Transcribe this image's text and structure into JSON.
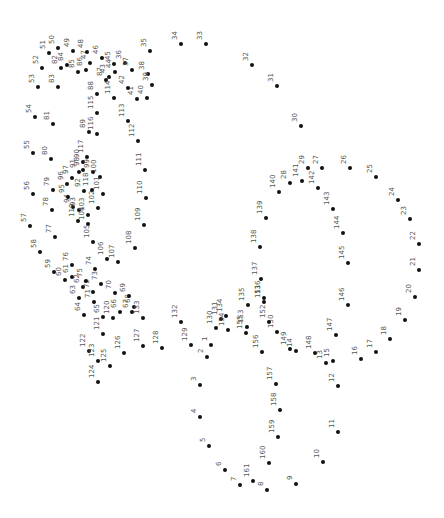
{
  "puzzle": {
    "type": "connect-the-dots",
    "total_dots": 161,
    "label_rotation_deg": -90,
    "dot_color": "#111111",
    "label_color": "#555555",
    "dots": [
      {
        "n": 1,
        "x": 211,
        "y": 345
      },
      {
        "n": 2,
        "x": 207,
        "y": 357
      },
      {
        "n": 3,
        "x": 200,
        "y": 385
      },
      {
        "n": 4,
        "x": 200,
        "y": 417
      },
      {
        "n": 5,
        "x": 209,
        "y": 446
      },
      {
        "n": 6,
        "x": 225,
        "y": 470
      },
      {
        "n": 7,
        "x": 240,
        "y": 485
      },
      {
        "n": 8,
        "x": 267,
        "y": 490
      },
      {
        "n": 9,
        "x": 296,
        "y": 484
      },
      {
        "n": 10,
        "x": 323,
        "y": 462
      },
      {
        "n": 11,
        "x": 338,
        "y": 432
      },
      {
        "n": 12,
        "x": 338,
        "y": 386
      },
      {
        "n": 13,
        "x": 326,
        "y": 363
      },
      {
        "n": 14,
        "x": 296,
        "y": 351
      },
      {
        "n": 15,
        "x": 333,
        "y": 361
      },
      {
        "n": 16,
        "x": 361,
        "y": 359
      },
      {
        "n": 17,
        "x": 376,
        "y": 352
      },
      {
        "n": 18,
        "x": 390,
        "y": 339
      },
      {
        "n": 19,
        "x": 405,
        "y": 320
      },
      {
        "n": 20,
        "x": 415,
        "y": 297
      },
      {
        "n": 21,
        "x": 419,
        "y": 270
      },
      {
        "n": 22,
        "x": 419,
        "y": 244
      },
      {
        "n": 23,
        "x": 410,
        "y": 219
      },
      {
        "n": 24,
        "x": 398,
        "y": 200
      },
      {
        "n": 25,
        "x": 376,
        "y": 177
      },
      {
        "n": 26,
        "x": 350,
        "y": 168
      },
      {
        "n": 27,
        "x": 322,
        "y": 168
      },
      {
        "n": 28,
        "x": 290,
        "y": 183
      },
      {
        "n": 29,
        "x": 308,
        "y": 168
      },
      {
        "n": 30,
        "x": 301,
        "y": 126
      },
      {
        "n": 31,
        "x": 277,
        "y": 86
      },
      {
        "n": 32,
        "x": 252,
        "y": 65
      },
      {
        "n": 33,
        "x": 206,
        "y": 44
      },
      {
        "n": 34,
        "x": 181,
        "y": 44
      },
      {
        "n": 35,
        "x": 150,
        "y": 51
      },
      {
        "n": 36,
        "x": 125,
        "y": 63
      },
      {
        "n": 37,
        "x": 132,
        "y": 70
      },
      {
        "n": 38,
        "x": 148,
        "y": 74
      },
      {
        "n": 39,
        "x": 152,
        "y": 85
      },
      {
        "n": 40,
        "x": 147,
        "y": 98
      },
      {
        "n": 41,
        "x": 137,
        "y": 99
      },
      {
        "n": 42,
        "x": 128,
        "y": 88
      },
      {
        "n": 43,
        "x": 109,
        "y": 77
      },
      {
        "n": 44,
        "x": 115,
        "y": 72
      },
      {
        "n": 45,
        "x": 114,
        "y": 64
      },
      {
        "n": 46,
        "x": 102,
        "y": 58
      },
      {
        "n": 47,
        "x": 90,
        "y": 63
      },
      {
        "n": 48,
        "x": 87,
        "y": 52
      },
      {
        "n": 49,
        "x": 73,
        "y": 51
      },
      {
        "n": 50,
        "x": 58,
        "y": 48
      },
      {
        "n": 51,
        "x": 49,
        "y": 53
      },
      {
        "n": 52,
        "x": 42,
        "y": 68
      },
      {
        "n": 53,
        "x": 38,
        "y": 87
      },
      {
        "n": 54,
        "x": 35,
        "y": 117
      },
      {
        "n": 55,
        "x": 33,
        "y": 153
      },
      {
        "n": 56,
        "x": 33,
        "y": 194
      },
      {
        "n": 57,
        "x": 30,
        "y": 226
      },
      {
        "n": 58,
        "x": 40,
        "y": 252
      },
      {
        "n": 59,
        "x": 54,
        "y": 272
      },
      {
        "n": 60,
        "x": 65,
        "y": 280
      },
      {
        "n": 61,
        "x": 72,
        "y": 277
      },
      {
        "n": 62,
        "x": 83,
        "y": 287
      },
      {
        "n": 63,
        "x": 79,
        "y": 298
      },
      {
        "n": 64,
        "x": 84,
        "y": 315
      },
      {
        "n": 65,
        "x": 103,
        "y": 317
      },
      {
        "n": 66,
        "x": 120,
        "y": 312
      },
      {
        "n": 67,
        "x": 132,
        "y": 312
      },
      {
        "n": 68,
        "x": 134,
        "y": 307
      },
      {
        "n": 69,
        "x": 129,
        "y": 296
      },
      {
        "n": 70,
        "x": 115,
        "y": 293
      },
      {
        "n": 71,
        "x": 94,
        "y": 302
      },
      {
        "n": 72,
        "x": 93,
        "y": 292
      },
      {
        "n": 73,
        "x": 101,
        "y": 284
      },
      {
        "n": 74,
        "x": 95,
        "y": 269
      },
      {
        "n": 75,
        "x": 86,
        "y": 281
      },
      {
        "n": 76,
        "x": 72,
        "y": 265
      },
      {
        "n": 77,
        "x": 55,
        "y": 237
      },
      {
        "n": 78,
        "x": 52,
        "y": 210
      },
      {
        "n": 79,
        "x": 53,
        "y": 190
      },
      {
        "n": 80,
        "x": 51,
        "y": 159
      },
      {
        "n": 81,
        "x": 53,
        "y": 124
      },
      {
        "n": 82,
        "x": 61,
        "y": 68
      },
      {
        "n": 83,
        "x": 58,
        "y": 87
      },
      {
        "n": 84,
        "x": 67,
        "y": 65
      },
      {
        "n": 85,
        "x": 78,
        "y": 72
      },
      {
        "n": 86,
        "x": 86,
        "y": 70
      },
      {
        "n": 87,
        "x": 106,
        "y": 80
      },
      {
        "n": 88,
        "x": 97,
        "y": 94
      },
      {
        "n": 89,
        "x": 89,
        "y": 132
      },
      {
        "n": 90,
        "x": 83,
        "y": 162
      },
      {
        "n": 91,
        "x": 79,
        "y": 172
      },
      {
        "n": 92,
        "x": 84,
        "y": 191
      },
      {
        "n": 93,
        "x": 79,
        "y": 210
      },
      {
        "n": 94,
        "x": 73,
        "y": 207
      },
      {
        "n": 95,
        "x": 68,
        "y": 197
      },
      {
        "n": 96,
        "x": 67,
        "y": 184
      },
      {
        "n": 97,
        "x": 72,
        "y": 178
      },
      {
        "n": 98,
        "x": 83,
        "y": 170
      },
      {
        "n": 99,
        "x": 93,
        "y": 172
      },
      {
        "n": 100,
        "x": 100,
        "y": 177
      },
      {
        "n": 101,
        "x": 103,
        "y": 194
      },
      {
        "n": 102,
        "x": 98,
        "y": 208
      },
      {
        "n": 103,
        "x": 88,
        "y": 215
      },
      {
        "n": 104,
        "x": 88,
        "y": 224
      },
      {
        "n": 105,
        "x": 93,
        "y": 242
      },
      {
        "n": 106,
        "x": 107,
        "y": 259
      },
      {
        "n": 107,
        "x": 118,
        "y": 262
      },
      {
        "n": 108,
        "x": 135,
        "y": 248
      },
      {
        "n": 109,
        "x": 144,
        "y": 225
      },
      {
        "n": 110,
        "x": 146,
        "y": 198
      },
      {
        "n": 111,
        "x": 145,
        "y": 170
      },
      {
        "n": 112,
        "x": 138,
        "y": 141
      },
      {
        "n": 113,
        "x": 128,
        "y": 121
      },
      {
        "n": 114,
        "x": 114,
        "y": 98
      },
      {
        "n": 115,
        "x": 97,
        "y": 113
      },
      {
        "n": 116,
        "x": 97,
        "y": 134
      },
      {
        "n": 117,
        "x": 87,
        "y": 157
      },
      {
        "n": 118,
        "x": 92,
        "y": 190
      },
      {
        "n": 119,
        "x": 78,
        "y": 221
      },
      {
        "n": 120,
        "x": 113,
        "y": 318
      },
      {
        "n": 121,
        "x": 103,
        "y": 334
      },
      {
        "n": 122,
        "x": 89,
        "y": 351
      },
      {
        "n": 123,
        "x": 98,
        "y": 361
      },
      {
        "n": 124,
        "x": 98,
        "y": 382
      },
      {
        "n": 125,
        "x": 110,
        "y": 366
      },
      {
        "n": 126,
        "x": 124,
        "y": 353
      },
      {
        "n": 127,
        "x": 143,
        "y": 346
      },
      {
        "n": 128,
        "x": 162,
        "y": 348
      },
      {
        "n": 129,
        "x": 191,
        "y": 345
      },
      {
        "n": 130,
        "x": 216,
        "y": 328
      },
      {
        "n": 131,
        "x": 221,
        "y": 319
      },
      {
        "n": 132,
        "x": 181,
        "y": 322
      },
      {
        "n": 133,
        "x": 143,
        "y": 318
      },
      {
        "n": 134,
        "x": 226,
        "y": 316
      },
      {
        "n": 135,
        "x": 248,
        "y": 305
      },
      {
        "n": 136,
        "x": 264,
        "y": 298
      },
      {
        "n": 137,
        "x": 261,
        "y": 279
      },
      {
        "n": 138,
        "x": 260,
        "y": 247
      },
      {
        "n": 139,
        "x": 266,
        "y": 218
      },
      {
        "n": 140,
        "x": 279,
        "y": 192
      },
      {
        "n": 141,
        "x": 302,
        "y": 181
      },
      {
        "n": 142,
        "x": 318,
        "y": 188
      },
      {
        "n": 143,
        "x": 333,
        "y": 209
      },
      {
        "n": 144,
        "x": 343,
        "y": 233
      },
      {
        "n": 145,
        "x": 348,
        "y": 263
      },
      {
        "n": 146,
        "x": 348,
        "y": 305
      },
      {
        "n": 147,
        "x": 336,
        "y": 335
      },
      {
        "n": 148,
        "x": 315,
        "y": 353
      },
      {
        "n": 149,
        "x": 290,
        "y": 349
      },
      {
        "n": 150,
        "x": 277,
        "y": 332
      },
      {
        "n": 151,
        "x": 264,
        "y": 302
      },
      {
        "n": 152,
        "x": 269,
        "y": 322
      },
      {
        "n": 153,
        "x": 247,
        "y": 327
      },
      {
        "n": 154,
        "x": 228,
        "y": 330
      },
      {
        "n": 155,
        "x": 246,
        "y": 333
      },
      {
        "n": 156,
        "x": 262,
        "y": 352
      },
      {
        "n": 157,
        "x": 276,
        "y": 384
      },
      {
        "n": 158,
        "x": 280,
        "y": 410
      },
      {
        "n": 159,
        "x": 278,
        "y": 437
      },
      {
        "n": 160,
        "x": 269,
        "y": 463
      },
      {
        "n": 161,
        "x": 253,
        "y": 481
      }
    ]
  }
}
